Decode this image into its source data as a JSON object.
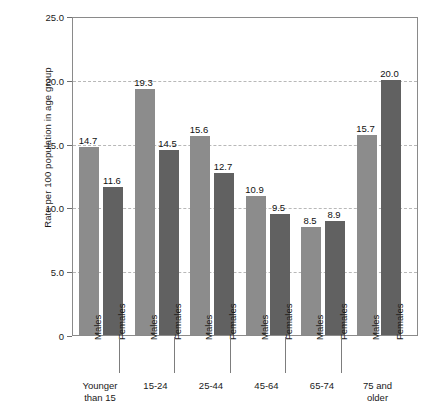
{
  "chart_data": {
    "type": "bar",
    "title": "",
    "xlabel": "",
    "ylabel": "Rate per 100 population in age group",
    "ylim": [
      0,
      25
    ],
    "ytick_labels": [
      "0",
      "5.0",
      "10.0",
      "15.0",
      "20.0",
      "25.0"
    ],
    "ytick_values": [
      0,
      5,
      10,
      15,
      20,
      25
    ],
    "grid": "horizontal dashed gridlines at 5.0, 10.0, 15.0, 20.0",
    "legend": "none (series identified by axis labels)",
    "categories": [
      "Younger than 15",
      "15-24",
      "25-44",
      "45-64",
      "65-74",
      "75 and older"
    ],
    "series": [
      {
        "name": "Males",
        "values": [
          14.7,
          19.3,
          15.6,
          10.9,
          8.5,
          15.7
        ],
        "color": "#8c8c8c"
      },
      {
        "name": "Females",
        "values": [
          11.6,
          14.5,
          12.7,
          9.5,
          8.9,
          20.0
        ],
        "color": "#616161"
      }
    ],
    "groups": [
      {
        "age_label": "Younger\nthan 15",
        "bars": [
          {
            "sex": "Males",
            "value": 14.7,
            "label": "14.7"
          },
          {
            "sex": "Females",
            "value": 11.6,
            "label": "11.6"
          }
        ]
      },
      {
        "age_label": "15-24",
        "bars": [
          {
            "sex": "Males",
            "value": 19.3,
            "label": "19.3"
          },
          {
            "sex": "Females",
            "value": 14.5,
            "label": "14.5"
          }
        ]
      },
      {
        "age_label": "25-44",
        "bars": [
          {
            "sex": "Males",
            "value": 15.6,
            "label": "15.6"
          },
          {
            "sex": "Females",
            "value": 12.7,
            "label": "12.7"
          }
        ]
      },
      {
        "age_label": "45-64",
        "bars": [
          {
            "sex": "Males",
            "value": 10.9,
            "label": "10.9"
          },
          {
            "sex": "Females",
            "value": 9.5,
            "label": "9.5"
          }
        ]
      },
      {
        "age_label": "65-74",
        "bars": [
          {
            "sex": "Males",
            "value": 8.5,
            "label": "8.5"
          },
          {
            "sex": "Females",
            "value": 8.9,
            "label": "8.9"
          }
        ]
      },
      {
        "age_label": "75 and\nolder",
        "bars": [
          {
            "sex": "Males",
            "value": 15.7,
            "label": "15.7"
          },
          {
            "sex": "Females",
            "value": 20.0,
            "label": "20.0"
          }
        ]
      }
    ]
  },
  "axis": {
    "y_title": "Rate per 100 population in age group",
    "y_ticks": [
      {
        "label": "25.0",
        "value": 25
      },
      {
        "label": "20.0",
        "value": 20
      },
      {
        "label": "15.0",
        "value": 15
      },
      {
        "label": "10.0",
        "value": 10
      },
      {
        "label": "5.0",
        "value": 5
      },
      {
        "label": "0",
        "value": 0
      }
    ]
  },
  "colors": {
    "male_bar": "#8c8c8c",
    "female_bar": "#616161",
    "frame": "#8a8a8a",
    "gridline": "#b8b8b8",
    "text": "#1a1a1a",
    "background": "#ffffff"
  }
}
